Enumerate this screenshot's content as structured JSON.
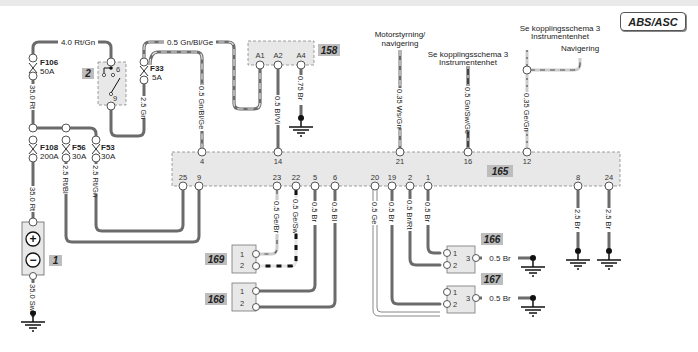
{
  "diagram": {
    "title": "ABS/ASC",
    "components": {
      "c1": {
        "id": "1",
        "name": "battery",
        "terminals": [
          "+",
          "−"
        ]
      },
      "c2": {
        "id": "2",
        "name": "relay",
        "pins": [
          "6",
          "9"
        ]
      },
      "c158": {
        "id": "158",
        "pins": [
          "A1",
          "A2",
          "A4"
        ]
      },
      "c165": {
        "id": "165",
        "pins_top": [
          "4",
          "14",
          "21",
          "16",
          "12"
        ],
        "pins_bottom": [
          "25",
          "9",
          "23",
          "22",
          "5",
          "6",
          "20",
          "19",
          "2",
          "1",
          "8",
          "24"
        ]
      },
      "c166": {
        "id": "166",
        "pins": [
          "1",
          "2",
          "3"
        ]
      },
      "c167": {
        "id": "167",
        "pins": [
          "1",
          "2",
          "3"
        ]
      },
      "c168": {
        "id": "168",
        "pins": [
          "1",
          "2"
        ]
      },
      "c169": {
        "id": "169",
        "pins": [
          "1",
          "2"
        ]
      }
    },
    "fuses": {
      "f106": {
        "name": "F106",
        "rating": "50A"
      },
      "f108": {
        "name": "F108",
        "rating": "200A"
      },
      "f56": {
        "name": "F56",
        "rating": "30A"
      },
      "f53": {
        "name": "F53",
        "rating": "30A"
      },
      "f33": {
        "name": "F33",
        "rating": "5A"
      }
    },
    "wires": {
      "w_top_rtgn": "4.0 Rt/Gn",
      "w_top_gnblge": "0.5 Gn/Bl/Ge",
      "w_f106_down": "35.0 Rt",
      "w_f108_down": "35.0 Rt",
      "w_bat_gnd": "35.0 Sw",
      "w_f56_down": "2.5 Rt/Bl",
      "w_f53_down": "2.5 Rt/Gn",
      "w_f33_down": "2.5 Gn",
      "w_pin4": "0.5 Gn/Bl/Ge",
      "w_pin14": "0.5 Bl/Vi",
      "w_a4_gnd": "0.75 Br",
      "w_pin21": "0.35 Ws/Gn",
      "w_pin16": "0.5 Gn/Sw/Ge",
      "w_pin12": "0.35 Ge/Gn",
      "w_pin23": "0.5 Ge/Br",
      "w_pin22": "0.5 Ge/Sw",
      "w_pin5": "0.5 Br",
      "w_pin6": "0.5 Bl",
      "w_pin20": "0.5 Ge",
      "w_pin19": "0.5 Br",
      "w_pin2": "0.5 Br/Rt",
      "w_pin1": "0.5 Br",
      "w_pin8": "2.5 Br",
      "w_pin24": "2.5 Br",
      "w_166_gnd": "0.5 Br",
      "w_167_gnd": "0.5 Br"
    },
    "annotations": {
      "motor": [
        "Motorstyrning/",
        "navigering"
      ],
      "instr16": [
        "Se kopplingsschema 3",
        "Instrumentenhet"
      ],
      "instr12": [
        "Se kopplingsschema 3",
        "Instrumentenhet"
      ],
      "nav": "Navigering"
    }
  },
  "colors": {
    "wire": "#6b6b6b",
    "wire_dash": "#e6e6e6",
    "dark_dash": "#1a1a1a",
    "connector_fill": "#e8e8e8",
    "tag_fill": "#bdbdbd"
  }
}
